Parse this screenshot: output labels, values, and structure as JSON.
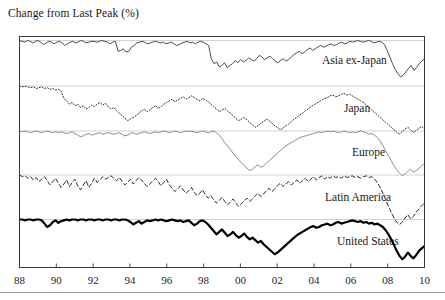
{
  "figure": {
    "title": "Change from Last Peak (%)",
    "background": "#ffffff",
    "frame_color": "#3a3a3a",
    "baseline_color": "#c8c8c8"
  },
  "chart_data": {
    "type": "line",
    "title": "Change from Last Peak (%)",
    "subtitle": "",
    "xlabel": "",
    "ylabel": "Change from Last Peak (%)",
    "layout": "small-multiples-stacked-panels",
    "grid": false,
    "legend_position": "inline-right-of-each-panel",
    "xlim": [
      1988,
      2010
    ],
    "x_tick_labels": [
      "88",
      "90",
      "92",
      "94",
      "96",
      "98",
      "00",
      "02",
      "04",
      "06",
      "08",
      "10"
    ],
    "x_tick_values": [
      1988,
      1990,
      1992,
      1994,
      1996,
      1998,
      2000,
      2002,
      2004,
      2006,
      2008,
      2010
    ],
    "x_step_years": 0.25,
    "panel_ylim": [
      -75,
      5
    ],
    "series": [
      {
        "name": "Asia ex-Japan",
        "label": "Asia ex-Japan",
        "style": "solid",
        "color": "#4a4a4a",
        "width": 1.0,
        "panel": 0,
        "values": [
          0,
          -1,
          -2,
          0,
          -1,
          -3,
          -1,
          0,
          -2,
          -5,
          -3,
          -1,
          -2,
          -4,
          -2,
          -1,
          -3,
          -6,
          -4,
          -2,
          -1,
          -3,
          -2,
          0,
          -1,
          -3,
          -2,
          -1,
          -1,
          -2,
          -1,
          0,
          -1,
          -2,
          -4,
          -2,
          -1,
          -13,
          -12,
          -10,
          -14,
          -13,
          -8,
          -6,
          -3,
          -2,
          -1,
          -2,
          -4,
          -3,
          -2,
          -1,
          -2,
          -3,
          -2,
          -4,
          -3,
          -2,
          -4,
          -6,
          -5,
          -3,
          -2,
          -1,
          -3,
          -2,
          -4,
          -2,
          -1,
          -2,
          -4,
          -6,
          -22,
          -28,
          -26,
          -32,
          -30,
          -27,
          -33,
          -30,
          -28,
          -24,
          -27,
          -23,
          -26,
          -24,
          -21,
          -23,
          -25,
          -22,
          -18,
          -20,
          -23,
          -21,
          -19,
          -22,
          -25,
          -27,
          -24,
          -22,
          -25,
          -23,
          -20,
          -17,
          -15,
          -13,
          -16,
          -14,
          -11,
          -9,
          -12,
          -10,
          -8,
          -6,
          -8,
          -7,
          -5,
          -4,
          -6,
          -5,
          -3,
          -2,
          -4,
          -3,
          -1,
          -2,
          -1,
          0,
          -1,
          -2,
          -1,
          0,
          -1,
          -3,
          -2,
          -1,
          -2,
          -5,
          -12,
          -20,
          -28,
          -35,
          -40,
          -44,
          -42,
          -38,
          -34,
          -30,
          -36,
          -33,
          -28,
          -25,
          -22
        ]
      },
      {
        "name": "Japan",
        "label": "Japan",
        "style": "dotted",
        "color": "#2a2a2a",
        "width": 1.0,
        "panel": 1,
        "values": [
          0,
          -1,
          0,
          -1,
          -2,
          -1,
          -3,
          -2,
          -1,
          -3,
          -2,
          -4,
          -3,
          -5,
          -4,
          -6,
          -15,
          -18,
          -22,
          -20,
          -24,
          -22,
          -26,
          -24,
          -28,
          -26,
          -23,
          -25,
          -22,
          -20,
          -23,
          -21,
          -25,
          -28,
          -26,
          -30,
          -33,
          -36,
          -39,
          -42,
          -40,
          -38,
          -36,
          -33,
          -30,
          -28,
          -31,
          -29,
          -26,
          -24,
          -27,
          -25,
          -22,
          -20,
          -18,
          -16,
          -19,
          -17,
          -15,
          -13,
          -16,
          -14,
          -12,
          -14,
          -16,
          -18,
          -15,
          -17,
          -19,
          -22,
          -25,
          -28,
          -31,
          -29,
          -27,
          -30,
          -33,
          -36,
          -39,
          -42,
          -40,
          -38,
          -41,
          -44,
          -47,
          -50,
          -48,
          -45,
          -43,
          -40,
          -42,
          -45,
          -48,
          -50,
          -53,
          -51,
          -48,
          -46,
          -43,
          -40,
          -38,
          -35,
          -33,
          -30,
          -28,
          -25,
          -23,
          -21,
          -19,
          -17,
          -15,
          -14,
          -12,
          -11,
          -13,
          -12,
          -10,
          -9,
          -11,
          -10,
          -12,
          -14,
          -16,
          -18,
          -20,
          -23,
          -26,
          -29,
          -32,
          -35,
          -38,
          -41,
          -44,
          -47,
          -50,
          -53,
          -56,
          -58,
          -55,
          -52,
          -50,
          -53,
          -56,
          -54,
          -51,
          -49,
          -52
        ]
      },
      {
        "name": "Europe",
        "label": "Europe",
        "style": "solid",
        "color": "#8c8c8c",
        "width": 1.0,
        "panel": 2,
        "values": [
          0,
          -1,
          0,
          -1,
          -2,
          -1,
          0,
          -1,
          -2,
          -1,
          0,
          -1,
          -2,
          -1,
          -2,
          -1,
          -2,
          -3,
          -2,
          -1,
          -3,
          -5,
          -7,
          -6,
          -4,
          -3,
          -5,
          -4,
          -3,
          -2,
          -4,
          -3,
          -2,
          -3,
          -4,
          -3,
          -2,
          -4,
          -6,
          -5,
          -3,
          -2,
          -4,
          -3,
          -2,
          -1,
          -2,
          -3,
          -2,
          -1,
          -2,
          -1,
          0,
          -1,
          -2,
          -1,
          0,
          -1,
          -2,
          -1,
          0,
          -1,
          0,
          -1,
          -2,
          -1,
          0,
          -1,
          -2,
          -1,
          0,
          -2,
          -5,
          -9,
          -14,
          -18,
          -22,
          -27,
          -31,
          -35,
          -38,
          -42,
          -45,
          -48,
          -46,
          -43,
          -41,
          -44,
          -42,
          -39,
          -36,
          -33,
          -30,
          -27,
          -24,
          -21,
          -18,
          -16,
          -14,
          -12,
          -10,
          -8,
          -7,
          -6,
          -5,
          -4,
          -3,
          -2,
          -1,
          -2,
          -1,
          0,
          -1,
          0,
          -1,
          -2,
          -1,
          0,
          -1,
          -2,
          -1,
          -2,
          -1,
          0,
          -1,
          -2,
          -4,
          -3,
          -5,
          -8,
          -12,
          -18,
          -24,
          -30,
          -36,
          -42,
          -47,
          -51,
          -54,
          -52,
          -49,
          -46,
          -50,
          -48,
          -45,
          -42,
          -40
        ]
      },
      {
        "name": "Latin America",
        "label": "Latin America",
        "style": "dashed",
        "color": "#2a2a2a",
        "width": 1.0,
        "panel": 3,
        "values": [
          0,
          -2,
          -1,
          -4,
          -2,
          -6,
          -3,
          -8,
          -5,
          -2,
          -7,
          -12,
          -8,
          -4,
          -10,
          -15,
          -11,
          -6,
          -14,
          -9,
          -5,
          -13,
          -18,
          -12,
          -7,
          -15,
          -10,
          -4,
          -9,
          -6,
          -2,
          -5,
          -3,
          -1,
          -4,
          -7,
          -3,
          -8,
          -12,
          -9,
          -5,
          -11,
          -7,
          -3,
          -6,
          -10,
          -14,
          -11,
          -7,
          -4,
          -8,
          -13,
          -9,
          -5,
          -12,
          -16,
          -20,
          -17,
          -13,
          -18,
          -22,
          -19,
          -15,
          -21,
          -25,
          -22,
          -18,
          -24,
          -28,
          -25,
          -30,
          -34,
          -31,
          -27,
          -32,
          -36,
          -33,
          -29,
          -34,
          -38,
          -35,
          -31,
          -28,
          -32,
          -29,
          -25,
          -22,
          -26,
          -23,
          -19,
          -16,
          -20,
          -17,
          -13,
          -10,
          -14,
          -11,
          -8,
          -12,
          -9,
          -6,
          -10,
          -7,
          -4,
          -8,
          -5,
          -2,
          -6,
          -3,
          -1,
          -5,
          -2,
          -4,
          -1,
          -3,
          -2,
          -4,
          -1,
          -3,
          -2,
          -1,
          -3,
          -2,
          -4,
          -2,
          -1,
          -3,
          -2,
          -5,
          -9,
          -15,
          -22,
          -30,
          -38,
          -45,
          -52,
          -57,
          -60,
          -57,
          -52,
          -48,
          -53,
          -50,
          -45,
          -41,
          -37,
          -34
        ]
      },
      {
        "name": "United States",
        "label": "United States",
        "style": "solid-thick",
        "color": "#000000",
        "width": 2.2,
        "panel": 4,
        "values": [
          0,
          0,
          -1,
          0,
          0,
          -1,
          0,
          0,
          -1,
          -5,
          -9,
          -7,
          -3,
          -1,
          -4,
          -2,
          -1,
          0,
          -1,
          0,
          0,
          -1,
          0,
          0,
          -1,
          0,
          0,
          -1,
          0,
          0,
          -1,
          0,
          0,
          -1,
          0,
          0,
          -1,
          0,
          0,
          -1,
          -3,
          -6,
          -4,
          -2,
          -5,
          -3,
          -1,
          -2,
          -1,
          0,
          -1,
          0,
          -1,
          -2,
          -1,
          0,
          -1,
          -2,
          -1,
          -3,
          -2,
          -1,
          -4,
          -7,
          -5,
          -2,
          -1,
          -3,
          -6,
          -10,
          -14,
          -18,
          -15,
          -12,
          -16,
          -20,
          -18,
          -15,
          -19,
          -22,
          -20,
          -17,
          -21,
          -24,
          -22,
          -25,
          -28,
          -26,
          -30,
          -33,
          -36,
          -39,
          -42,
          -40,
          -37,
          -34,
          -31,
          -28,
          -25,
          -22,
          -19,
          -17,
          -15,
          -13,
          -11,
          -9,
          -8,
          -10,
          -9,
          -7,
          -6,
          -5,
          -7,
          -6,
          -4,
          -3,
          -5,
          -4,
          -3,
          -2,
          -1,
          -2,
          -3,
          -2,
          -4,
          -3,
          -5,
          -4,
          -6,
          -5,
          -7,
          -9,
          -13,
          -18,
          -24,
          -31,
          -38,
          -44,
          -48,
          -45,
          -40,
          -44,
          -47,
          -43,
          -38,
          -35,
          -32
        ]
      }
    ]
  },
  "x_axis": {
    "ticks": [
      {
        "label": "88",
        "value": 1988
      },
      {
        "label": "90",
        "value": 1990
      },
      {
        "label": "92",
        "value": 1992
      },
      {
        "label": "94",
        "value": 1994
      },
      {
        "label": "96",
        "value": 1996
      },
      {
        "label": "98",
        "value": 1998
      },
      {
        "label": "00",
        "value": 2000
      },
      {
        "label": "02",
        "value": 2002
      },
      {
        "label": "04",
        "value": 2004
      },
      {
        "label": "06",
        "value": 2006
      },
      {
        "label": "08",
        "value": 2008
      },
      {
        "label": "10",
        "value": 2010
      }
    ]
  }
}
